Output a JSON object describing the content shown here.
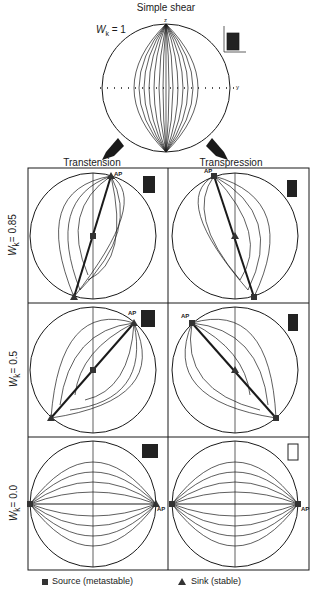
{
  "header": {
    "title": "Simple shear",
    "wk_label": "W",
    "wk_sub": "k",
    "wk_value": "= 1",
    "axis_z": "z",
    "axis_y": "y"
  },
  "columns": [
    {
      "label": "Transtension"
    },
    {
      "label": "Transpression"
    }
  ],
  "rows": [
    {
      "label": "Wk = 0.85",
      "prefix": "W",
      "sub": "k",
      "value": "= 0.85"
    },
    {
      "label": "Wk = 0.5",
      "prefix": "W",
      "sub": "k",
      "value": "= 0.5"
    },
    {
      "label": "Wk = 0.0",
      "prefix": "W",
      "sub": "k",
      "value": "= 0.0"
    }
  ],
  "annotations": {
    "ap": "AP"
  },
  "legend": {
    "source": {
      "symbol": "square",
      "label": "Source (metastable)"
    },
    "sink": {
      "symbol": "triangle",
      "label": "Sink (stable)"
    }
  },
  "colors": {
    "line": "#1a1a1a",
    "marker": "#333333",
    "inset": "#222222"
  }
}
